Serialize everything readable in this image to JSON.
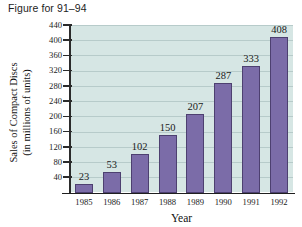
{
  "figure": {
    "caption": "Figure for 91–94"
  },
  "colors": {
    "bar_fill": "#7b6ca8",
    "bar_edge": "#4d4070",
    "plot_background": "#d6e6e4",
    "axis": "#1f1f1f",
    "text": "#1a1a1a",
    "page_background": "#ffffff"
  },
  "chart_data": {
    "type": "bar",
    "title": "Figure for 91–94",
    "categories": [
      "1985",
      "1986",
      "1987",
      "1988",
      "1989",
      "1990",
      "1991",
      "1992"
    ],
    "values": [
      23,
      53,
      102,
      150,
      207,
      287,
      333,
      408
    ],
    "data_labels": [
      "23",
      "53",
      "102",
      "150",
      "207",
      "287",
      "333",
      "408"
    ],
    "xlabel": "Year",
    "ylabel": "Sales of Compact Discs (in millions of units)",
    "ylabel_line1": "Sales of Compact Discs",
    "ylabel_line2": "(in millions of units)",
    "ylim": [
      0,
      440
    ],
    "ytick_values": [
      40,
      80,
      120,
      160,
      200,
      240,
      280,
      320,
      360,
      400,
      440
    ],
    "ytick_labels": [
      "40",
      "80",
      "120",
      "160",
      "200",
      "240",
      "280",
      "320",
      "360",
      "400",
      "440"
    ],
    "grid": true,
    "grid_axis": "y",
    "legend": null,
    "series_name": "Sales of Compact Discs"
  }
}
